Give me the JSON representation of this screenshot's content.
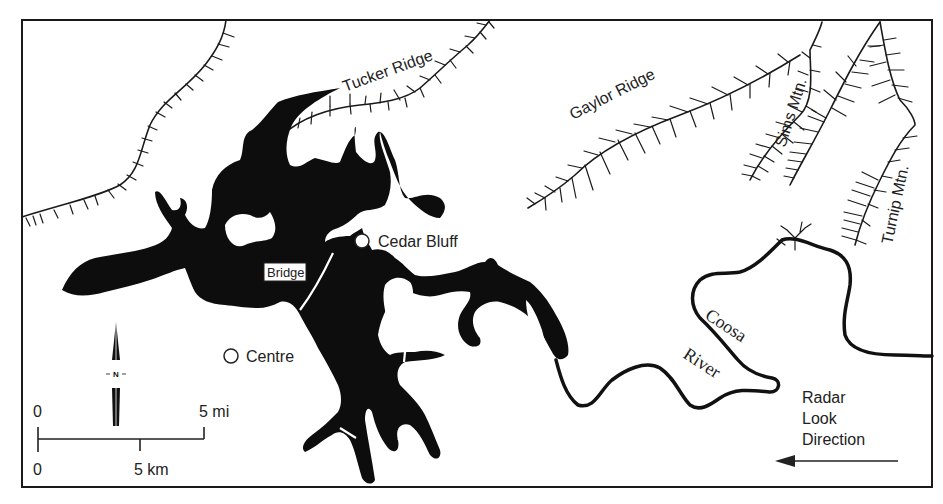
{
  "map": {
    "title": "Weiss Lake area, Coosa River (radar map sketch)",
    "labels": {
      "tucker_ridge": "Tucker Ridge",
      "gaylor_ridge": "Gaylor Ridge",
      "sims_mtn": "Sims Mtn.",
      "turnip_mtn": "Turnip Mtn.",
      "cedar_bluff": "Cedar Bluff",
      "centre": "Centre",
      "bridge": "Bridge",
      "coosa": "Coosa",
      "river": "River"
    },
    "radar": {
      "line1": "Radar",
      "line2": "Look",
      "line3": "Direction",
      "arrow": "arrow-left"
    },
    "north_arrow": {
      "label": "N"
    },
    "scale_bar": {
      "mi_start": "0",
      "mi_end": "5 mi",
      "km_start": "0",
      "km_mid": "5 km"
    },
    "colors": {
      "ink": "#111111",
      "paper": "#ffffff"
    }
  }
}
